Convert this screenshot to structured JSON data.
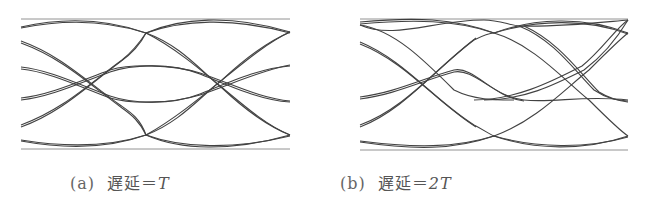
{
  "figure": {
    "panels": [
      {
        "id": "a",
        "letter": "(a)",
        "caption_text": "遅延＝",
        "caption_math": "T",
        "delay": "T"
      },
      {
        "id": "b",
        "letter": "(b)",
        "caption_text": "遅延＝",
        "caption_math": "2T",
        "delay": "2T"
      }
    ],
    "colors": {
      "trace": "#333333",
      "frame": "#777777",
      "caption": "#555555"
    }
  }
}
